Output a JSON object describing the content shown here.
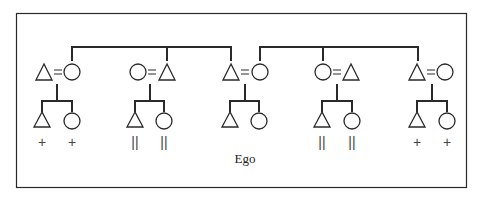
{
  "diagram": {
    "type": "kinship-chart",
    "ego_label": "Ego",
    "colors": {
      "stroke": "#2a2a2a",
      "background": "#ffffff"
    },
    "couples": [
      {
        "id": "c1",
        "left": "triangle",
        "right": "circle",
        "children": [
          {
            "shape": "triangle",
            "mark": "+"
          },
          {
            "shape": "circle",
            "mark": "+"
          }
        ]
      },
      {
        "id": "c2",
        "left": "circle",
        "right": "triangle",
        "children": [
          {
            "shape": "triangle",
            "mark": "||"
          },
          {
            "shape": "circle",
            "mark": "||"
          }
        ]
      },
      {
        "id": "c3",
        "left": "triangle",
        "right": "circle",
        "children": [
          {
            "shape": "triangle",
            "mark": ""
          },
          {
            "shape": "circle",
            "mark": ""
          }
        ],
        "note": "Ego's parents"
      },
      {
        "id": "c4",
        "left": "circle",
        "right": "triangle",
        "children": [
          {
            "shape": "triangle",
            "mark": "||"
          },
          {
            "shape": "circle",
            "mark": "||"
          }
        ]
      },
      {
        "id": "c5",
        "left": "triangle",
        "right": "circle",
        "children": [
          {
            "shape": "triangle",
            "mark": "+"
          },
          {
            "shape": "circle",
            "mark": "+"
          }
        ]
      }
    ],
    "marks": {
      "c1_child1": "+",
      "c1_child2": "+",
      "c2_child1": "||",
      "c2_child2": "||",
      "c4_child1": "||",
      "c4_child2": "||",
      "c5_child1": "+",
      "c5_child2": "+"
    },
    "marriage_symbol": "="
  }
}
